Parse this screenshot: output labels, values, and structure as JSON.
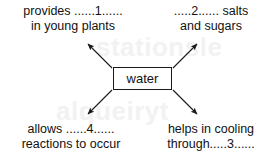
{
  "diagram": {
    "type": "concept-map",
    "center": {
      "label": "water"
    },
    "watermark": {
      "line1": "stationsle",
      "line2": "alqueiryt"
    },
    "branches": [
      {
        "id": "top-left",
        "position": "top-left",
        "blank_number": "1",
        "line1": "provides ......1......",
        "line2": "in young plants",
        "arrow": "arrow-up-left"
      },
      {
        "id": "top-right",
        "position": "top-right",
        "blank_number": "2",
        "line1": ".....2...... salts",
        "line2": "and sugars",
        "arrow": "arrow-up-right"
      },
      {
        "id": "bottom-left",
        "position": "bottom-left",
        "blank_number": "4",
        "line1": "allows ......4......",
        "line2": "reactions to occur",
        "arrow": "arrow-down-left"
      },
      {
        "id": "bottom-right",
        "position": "bottom-right",
        "blank_number": "3",
        "line1": "helps in cooling",
        "line2": "through.....3......",
        "arrow": "arrow-down-right"
      }
    ],
    "colors": {
      "stroke": "#1a1a1a",
      "text": "#111111",
      "background": "#ffffff",
      "watermark": "#f2f2f2"
    }
  }
}
